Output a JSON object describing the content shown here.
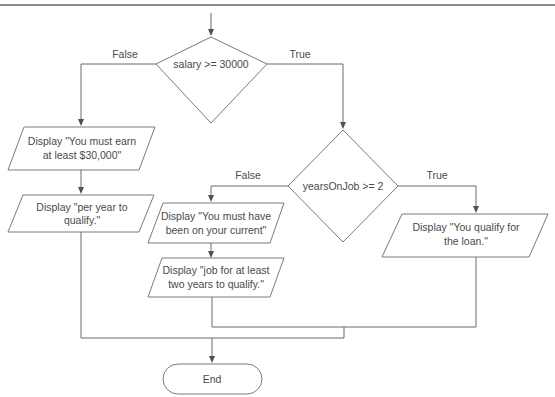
{
  "diagram": {
    "type": "flowchart",
    "decisions": [
      {
        "id": "d1",
        "text": "salary >= 30000",
        "false_label": "False",
        "true_label": "True"
      },
      {
        "id": "d2",
        "text": "yearsOnJob >= 2",
        "false_label": "False",
        "true_label": "True"
      }
    ],
    "outputs": {
      "salary_fail_1": {
        "line1": "Display \"You must earn",
        "line2": "at least $30,000\""
      },
      "salary_fail_2": {
        "line1": "Display \"per year to",
        "line2": "qualify.\""
      },
      "years_fail_1": {
        "line1": "Display \"You must have",
        "line2": "been on your current\""
      },
      "years_fail_2": {
        "line1": "Display \"job for at least",
        "line2": "two years to qualify.\""
      },
      "qualify": {
        "line1": "Display \"You qualify for",
        "line2": "the loan.\""
      }
    },
    "terminator": {
      "text": "End"
    }
  },
  "colors": {
    "line": "#6a6a6a",
    "shape_stroke": "#7a7a7a",
    "text": "#4a4a4a",
    "background": "#ffffff"
  }
}
